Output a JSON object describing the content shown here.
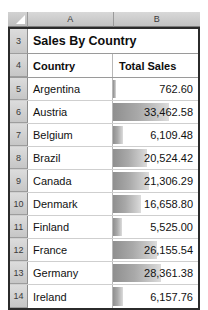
{
  "spreadsheet": {
    "corner_icon": "select-all-triangle-icon",
    "column_headers": [
      "A",
      "B"
    ],
    "title_row": {
      "row_number": "3",
      "title": "Sales By Country"
    },
    "header_row": {
      "row_number": "4",
      "columns": [
        "Country",
        "Total Sales"
      ]
    },
    "databar_max": 33462.58,
    "databar_color": "#9a9a9a",
    "rows": [
      {
        "row_number": "5",
        "country": "Argentina",
        "total_sales": "762.60",
        "value": 762.6
      },
      {
        "row_number": "6",
        "country": "Austria",
        "total_sales": "33,462.58",
        "value": 33462.58
      },
      {
        "row_number": "7",
        "country": "Belgium",
        "total_sales": "6,109.48",
        "value": 6109.48
      },
      {
        "row_number": "8",
        "country": "Brazil",
        "total_sales": "20,524.42",
        "value": 20524.42
      },
      {
        "row_number": "9",
        "country": "Canada",
        "total_sales": "21,306.29",
        "value": 21306.29
      },
      {
        "row_number": "10",
        "country": "Denmark",
        "total_sales": "16,658.80",
        "value": 16658.8
      },
      {
        "row_number": "11",
        "country": "Finland",
        "total_sales": "5,525.00",
        "value": 5525.0
      },
      {
        "row_number": "12",
        "country": "France",
        "total_sales": "26,155.54",
        "value": 26155.54
      },
      {
        "row_number": "13",
        "country": "Germany",
        "total_sales": "28,361.38",
        "value": 28361.38
      },
      {
        "row_number": "14",
        "country": "Ireland",
        "total_sales": "6,157.76",
        "value": 6157.76
      }
    ]
  }
}
